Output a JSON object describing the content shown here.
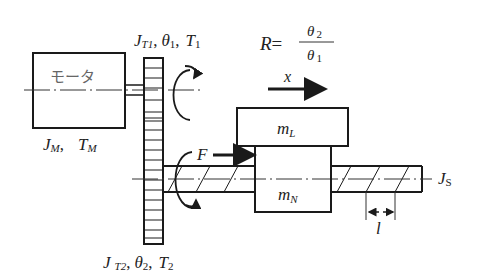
{
  "diagram": {
    "type": "motor-gear-ballscrew-drive",
    "motor": {
      "label": "モータ",
      "params": {
        "J": "J",
        "J_sub": "M",
        "T": "T",
        "T_sub": "M"
      }
    },
    "gear1": {
      "J": "J",
      "J_sub": "T1",
      "theta": "θ",
      "theta_sub": "1",
      "T": "T",
      "T_sub": "1"
    },
    "gear2": {
      "J": "J",
      "J_sub": "T2",
      "theta": "θ",
      "theta_sub": "2",
      "T": "T",
      "T_sub": "2"
    },
    "ratio": {
      "lhs": "R",
      "eq": "=",
      "num": "θ",
      "num_sub": "2",
      "den": "θ",
      "den_sub": "1"
    },
    "displacement": {
      "label": "x"
    },
    "force": {
      "label": "F"
    },
    "load_mass": {
      "m": "m",
      "sub": "L"
    },
    "nut_mass": {
      "m": "m",
      "sub": "N"
    },
    "screw": {
      "J": "J",
      "J_sub": "S"
    },
    "lead": {
      "label": "l"
    },
    "sep": ",",
    "colors": {
      "line": "#1a1a1a",
      "text": "#222222",
      "faint": "#666666"
    }
  }
}
